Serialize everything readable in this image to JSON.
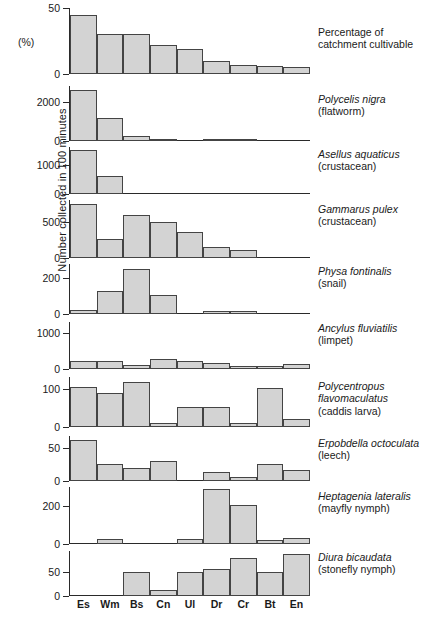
{
  "figure": {
    "ylabel": "Number collected in 100 minutes",
    "pct_label": "(%)",
    "categories": [
      "Es",
      "Wm",
      "Bs",
      "Cn",
      "Ul",
      "Dr",
      "Cr",
      "Bt",
      "En"
    ],
    "bar_fill": "#d3d3d3",
    "bar_stroke": "#444444"
  },
  "chart_data": [
    {
      "type": "bar",
      "title": "Percentage of catchment cultivable",
      "sci_name": "",
      "common_name": "",
      "ylabel": "(%)",
      "xlabel": "",
      "categories": [
        "Es",
        "Wm",
        "Bs",
        "Cn",
        "Ul",
        "Dr",
        "Cr",
        "Bt",
        "En"
      ],
      "values": [
        45,
        30,
        30,
        22,
        19,
        10,
        7,
        6,
        5
      ],
      "ylim": [
        0,
        50
      ],
      "ticks": [
        0,
        50
      ],
      "grid": false
    },
    {
      "type": "bar",
      "title": "Polycelis nigra (flatworm)",
      "sci_name": "Polycelis nigra",
      "common_name": "(flatworm)",
      "ylabel": "",
      "xlabel": "",
      "categories": [
        "Es",
        "Wm",
        "Bs",
        "Cn",
        "Ul",
        "Dr",
        "Cr",
        "Bt",
        "En"
      ],
      "values": [
        2600,
        1150,
        260,
        60,
        0,
        10,
        10,
        0,
        0
      ],
      "ylim": [
        0,
        2800
      ],
      "ticks": [
        0,
        2000
      ],
      "grid": false
    },
    {
      "type": "bar",
      "title": "Asellus aquaticus (crustacean)",
      "sci_name": "Asellus aquaticus",
      "common_name": "(crustacean)",
      "ylabel": "",
      "xlabel": "",
      "categories": [
        "Es",
        "Wm",
        "Bs",
        "Cn",
        "Ul",
        "Dr",
        "Cr",
        "Bt",
        "En"
      ],
      "values": [
        1500,
        620,
        0,
        0,
        0,
        0,
        0,
        0,
        0
      ],
      "ylim": [
        0,
        1600
      ],
      "ticks": [
        0,
        1000
      ],
      "grid": false
    },
    {
      "type": "bar",
      "title": "Gammarus pulex (crustacean)",
      "sci_name": "Gammarus pulex",
      "common_name": "(crustacean)",
      "ylabel": "",
      "xlabel": "",
      "categories": [
        "Es",
        "Wm",
        "Bs",
        "Cn",
        "Ul",
        "Dr",
        "Cr",
        "Bt",
        "En"
      ],
      "values": [
        750,
        260,
        600,
        500,
        360,
        150,
        110,
        0,
        0
      ],
      "ylim": [
        0,
        800
      ],
      "ticks": [
        0,
        500
      ],
      "grid": false
    },
    {
      "type": "bar",
      "title": "Physa fontinalis (snail)",
      "sci_name": "Physa fontinalis",
      "common_name": "(snail)",
      "ylabel": "",
      "xlabel": "",
      "categories": [
        "Es",
        "Wm",
        "Bs",
        "Cn",
        "Ul",
        "Dr",
        "Cr",
        "Bt",
        "En"
      ],
      "values": [
        20,
        130,
        250,
        105,
        0,
        18,
        15,
        0,
        0
      ],
      "ylim": [
        0,
        280
      ],
      "ticks": [
        0,
        200
      ],
      "grid": false
    },
    {
      "type": "bar",
      "title": "Ancylus fluviatilis (limpet)",
      "sci_name": "Ancylus fluviatilis",
      "common_name": "(limpet)",
      "ylabel": "",
      "xlabel": "",
      "categories": [
        "Es",
        "Wm",
        "Bs",
        "Cn",
        "Ul",
        "Dr",
        "Cr",
        "Bt",
        "En"
      ],
      "values": [
        230,
        230,
        105,
        290,
        215,
        165,
        85,
        80,
        140
      ],
      "ylim": [
        0,
        1300
      ],
      "ticks": [
        0,
        1000
      ],
      "grid": false
    },
    {
      "type": "bar",
      "title": "Polycentropus flavomaculatus (caddis larva)",
      "sci_name_line1": "Polycentropus",
      "sci_name_line2": "flavomaculatus",
      "common_name": "(caddis larva)",
      "ylabel": "",
      "xlabel": "",
      "categories": [
        "Es",
        "Wm",
        "Bs",
        "Cn",
        "Ul",
        "Dr",
        "Cr",
        "Bt",
        "En"
      ],
      "values": [
        103,
        88,
        118,
        10,
        52,
        52,
        10,
        102,
        22
      ],
      "ylim": [
        0,
        130
      ],
      "ticks": [
        0,
        100
      ],
      "grid": false
    },
    {
      "type": "bar",
      "title": "Erpobdella octoculata (leech)",
      "sci_name": "Erpobdella octoculata",
      "common_name": "(leech)",
      "ylabel": "",
      "xlabel": "",
      "categories": [
        "Es",
        "Wm",
        "Bs",
        "Cn",
        "Ul",
        "Dr",
        "Cr",
        "Bt",
        "En"
      ],
      "values": [
        62,
        26,
        19,
        31,
        0,
        13,
        6,
        25,
        17
      ],
      "ylim": [
        0,
        68
      ],
      "ticks": [
        0,
        50
      ],
      "grid": false
    },
    {
      "type": "bar",
      "title": "Heptagenia lateralis (mayfly nymph)",
      "sci_name": "Heptagenia lateralis",
      "common_name": "(mayfly nymph)",
      "ylabel": "",
      "xlabel": "",
      "categories": [
        "Es",
        "Wm",
        "Bs",
        "Cn",
        "Ul",
        "Dr",
        "Cr",
        "Bt",
        "En"
      ],
      "values": [
        0,
        25,
        0,
        0,
        28,
        290,
        205,
        22,
        32
      ],
      "ylim": [
        0,
        300
      ],
      "ticks": [
        0,
        200
      ],
      "grid": false
    },
    {
      "type": "bar",
      "title": "Diura bicaudata (stonefly nymph)",
      "sci_name": "Diura bicaudata",
      "common_name": "(stonefly nymph)",
      "ylabel": "",
      "xlabel": "",
      "categories": [
        "Es",
        "Wm",
        "Bs",
        "Cn",
        "Ul",
        "Dr",
        "Cr",
        "Bt",
        "En"
      ],
      "values": [
        0,
        0,
        50,
        12,
        50,
        56,
        78,
        50,
        86
      ],
      "ylim": [
        0,
        92
      ],
      "ticks": [
        0,
        50
      ],
      "grid": false
    }
  ]
}
